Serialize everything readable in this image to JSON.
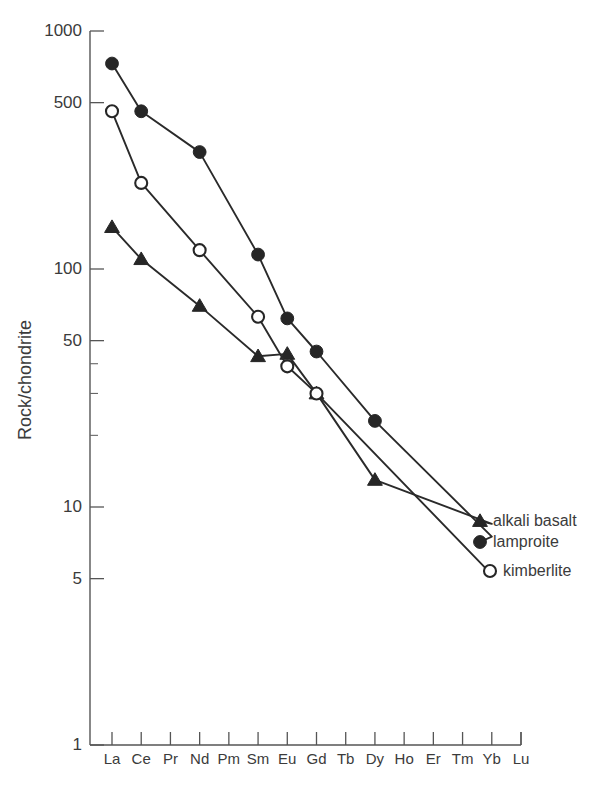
{
  "chart_data": {
    "type": "line",
    "title": "",
    "xlabel": "",
    "ylabel": "Rock/chondrite",
    "log_y": true,
    "grid": false,
    "ylim": [
      1,
      1000
    ],
    "y_tick_labels": [
      "1000",
      "500",
      "100",
      "50",
      "10",
      "5",
      "1"
    ],
    "y_tick_values": [
      1000,
      500,
      100,
      50,
      10,
      5,
      1
    ],
    "y_minor_ticks": [
      40,
      30,
      20
    ],
    "categories": [
      "La",
      "Ce",
      "Pr",
      "Nd",
      "Pm",
      "Sm",
      "Eu",
      "Gd",
      "Tb",
      "Dy",
      "Ho",
      "Er",
      "Tm",
      "Yb",
      "Lu"
    ],
    "legend_position": "right-inside",
    "series": [
      {
        "name": "alkali basalt",
        "marker": "filled-triangle",
        "x": [
          "La",
          "Ce",
          "Nd",
          "Sm",
          "Eu",
          "Gd",
          "Dy",
          "Yb"
        ],
        "values": [
          150,
          110,
          70,
          43,
          44,
          30,
          13,
          8.5
        ]
      },
      {
        "name": "lamproite",
        "marker": "filled-circle",
        "x": [
          "La",
          "Ce",
          "Nd",
          "Sm",
          "Eu",
          "Gd",
          "Dy",
          "Yb"
        ],
        "values": [
          730,
          460,
          310,
          115,
          62,
          45,
          23,
          7.5
        ]
      },
      {
        "name": "kimberlite",
        "marker": "open-circle",
        "x": [
          "La",
          "Ce",
          "Nd",
          "Sm",
          "Eu",
          "Gd",
          "Yb"
        ],
        "values": [
          460,
          230,
          120,
          63,
          39,
          30,
          5.2
        ]
      }
    ],
    "legend": [
      {
        "label": "alkali basalt",
        "marker": "filled-triangle"
      },
      {
        "label": "lamproite",
        "marker": "filled-circle"
      },
      {
        "label": "kimberlite",
        "marker": "open-circle"
      }
    ],
    "colors": {
      "ink": "#262626",
      "axis": "#555555",
      "text": "#3b3b3b",
      "background": "#ffffff"
    }
  }
}
